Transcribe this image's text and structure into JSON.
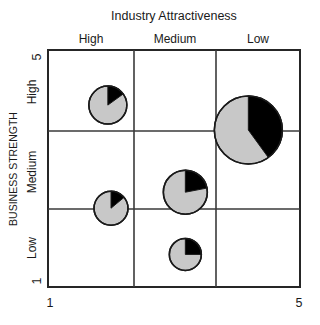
{
  "chart_data": {
    "type": "scatter",
    "title": "Industry Attractiveness",
    "xlabel": "Industry Attractiveness",
    "ylabel": "BUSINESS STRENGTH",
    "xlim": [
      1,
      5
    ],
    "ylim": [
      1,
      5
    ],
    "x_axis_min_label": "1",
    "x_axis_max_label": "5",
    "y_axis_min_label": "1",
    "y_axis_max_label": "5",
    "grid": true,
    "grid_rows": 3,
    "grid_cols": 3,
    "x_categories": [
      "High",
      "Medium",
      "Low"
    ],
    "y_categories": [
      "High",
      "Medium",
      "Low"
    ],
    "legend": null,
    "marker_style": "pie-bubble",
    "colors": {
      "bubble_fill": "#c8c8c8",
      "bubble_slice": "#000000",
      "outline": "#1a1a1a",
      "grid": "#3a3a3a",
      "background": "#ffffff"
    },
    "points": [
      {
        "name": "unit-1",
        "cell": "High / High",
        "x": 1.95,
        "y": 4.07,
        "radius_px": 19,
        "share_pct": 15
      },
      {
        "name": "unit-2",
        "cell": "Low / High",
        "x": 4.18,
        "y": 3.65,
        "radius_px": 34,
        "share_pct": 40
      },
      {
        "name": "unit-3",
        "cell": "Medium / Medium",
        "x": 3.18,
        "y": 2.6,
        "radius_px": 22,
        "share_pct": 22
      },
      {
        "name": "unit-4",
        "cell": "High / Medium",
        "x": 2.0,
        "y": 2.33,
        "radius_px": 17,
        "share_pct": 14
      },
      {
        "name": "unit-5",
        "cell": "Medium / Low",
        "x": 3.18,
        "y": 1.55,
        "radius_px": 16,
        "share_pct": 25
      }
    ]
  },
  "chart": {
    "title": "Industry Attractiveness",
    "y_axis_title": "BUSINESS STRENGTH",
    "x_tick_low": "1",
    "x_tick_high": "5",
    "y_tick_low": "1",
    "y_tick_high": "5",
    "col_high": "High",
    "col_medium": "Medium",
    "col_low": "Low",
    "row_high": "High",
    "row_medium": "Medium",
    "row_low": "Low"
  }
}
